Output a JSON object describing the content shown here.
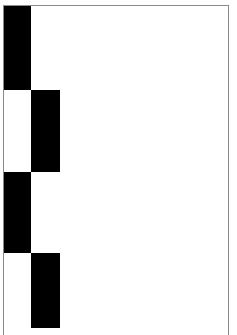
{
  "page": {
    "background": "#ffffff",
    "border_color": "#8a8a8a",
    "block_color": "#000000"
  },
  "blocks": [
    {
      "column": 1,
      "row": 1,
      "x": 4,
      "y": 6,
      "w": 27,
      "h": 84
    },
    {
      "column": 2,
      "row": 2,
      "x": 31,
      "y": 90,
      "w": 29,
      "h": 82
    },
    {
      "column": 1,
      "row": 3,
      "x": 4,
      "y": 172,
      "w": 27,
      "h": 81
    },
    {
      "column": 2,
      "row": 4,
      "x": 31,
      "y": 253,
      "w": 29,
      "h": 75
    }
  ]
}
